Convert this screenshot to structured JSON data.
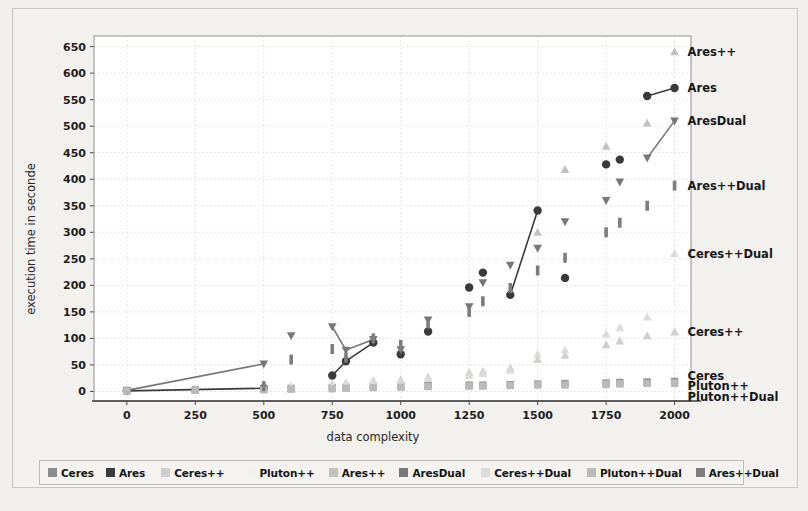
{
  "figure": {
    "background": "#f2f1ee",
    "plot_background": "#ffffff"
  },
  "chart_data": {
    "type": "scatter",
    "title": "",
    "xlabel": "data complexity",
    "ylabel": "execution time in seconde",
    "xlim": [
      -120,
      2060
    ],
    "ylim": [
      -18,
      670
    ],
    "xticks": [
      0,
      250,
      500,
      750,
      1000,
      1250,
      1500,
      1750,
      2000
    ],
    "yticks": [
      0,
      50,
      100,
      150,
      200,
      250,
      300,
      350,
      400,
      450,
      500,
      550,
      600,
      650
    ],
    "grid": true,
    "legend_position": "below-axes",
    "series": [
      {
        "name": "Ceres",
        "color": "#8c8c8c",
        "marker": "square",
        "points": [
          [
            0,
            2
          ],
          [
            250,
            3
          ],
          [
            500,
            5
          ],
          [
            600,
            6
          ],
          [
            750,
            7
          ],
          [
            800,
            8
          ],
          [
            900,
            9
          ],
          [
            1000,
            10
          ],
          [
            1100,
            11
          ],
          [
            1250,
            12
          ],
          [
            1300,
            12
          ],
          [
            1400,
            13
          ],
          [
            1500,
            14
          ],
          [
            1600,
            15
          ],
          [
            1750,
            16
          ],
          [
            1800,
            17
          ],
          [
            1900,
            18
          ],
          [
            2000,
            19
          ]
        ]
      },
      {
        "name": "Ares",
        "color": "#3a3a3a",
        "marker": "circle",
        "points": [
          [
            0,
            1
          ],
          [
            500,
            6
          ],
          [
            750,
            30
          ],
          [
            800,
            57
          ],
          [
            900,
            92
          ],
          [
            1000,
            70
          ],
          [
            1100,
            113
          ],
          [
            1250,
            196
          ],
          [
            1300,
            224
          ],
          [
            1400,
            182
          ],
          [
            1500,
            341
          ],
          [
            1600,
            214
          ],
          [
            1750,
            428
          ],
          [
            1800,
            437
          ],
          [
            1900,
            557
          ],
          [
            2000,
            572
          ]
        ]
      },
      {
        "name": "Ceres++",
        "color": "#d0cfcc",
        "marker": "triangle-up",
        "points": [
          [
            0,
            1
          ],
          [
            250,
            2
          ],
          [
            500,
            8
          ],
          [
            600,
            9
          ],
          [
            750,
            14
          ],
          [
            800,
            16
          ],
          [
            900,
            20
          ],
          [
            1000,
            22
          ],
          [
            1100,
            27
          ],
          [
            1250,
            35
          ],
          [
            1300,
            38
          ],
          [
            1400,
            44
          ],
          [
            1500,
            60
          ],
          [
            1600,
            68
          ],
          [
            1750,
            88
          ],
          [
            1800,
            95
          ],
          [
            1900,
            105
          ],
          [
            2000,
            112
          ]
        ]
      },
      {
        "name": "Pluton++",
        "color": "#a8a6a2",
        "marker": "square",
        "points": [
          [
            0,
            1
          ],
          [
            250,
            2
          ],
          [
            500,
            4
          ],
          [
            600,
            5
          ],
          [
            750,
            6
          ],
          [
            800,
            7
          ],
          [
            900,
            8
          ],
          [
            1000,
            9
          ],
          [
            1100,
            10
          ],
          [
            1250,
            11
          ],
          [
            1300,
            11
          ],
          [
            1400,
            12
          ],
          [
            1500,
            13
          ],
          [
            1600,
            14
          ],
          [
            1750,
            15
          ],
          [
            1800,
            15
          ],
          [
            1900,
            16
          ],
          [
            2000,
            17
          ]
        ]
      },
      {
        "name": "Ares++",
        "color": "#c2c1bd",
        "marker": "triangle-up",
        "points": [
          [
            1500,
            300
          ],
          [
            1600,
            418
          ],
          [
            1750,
            462
          ],
          [
            1900,
            506
          ],
          [
            2000,
            640
          ]
        ]
      },
      {
        "name": "AresDual",
        "color": "#77777a",
        "marker": "triangle-down",
        "points": [
          [
            0,
            2
          ],
          [
            500,
            52
          ],
          [
            600,
            105
          ],
          [
            750,
            122
          ],
          [
            800,
            78
          ],
          [
            900,
            98
          ],
          [
            1000,
            79
          ],
          [
            1100,
            135
          ],
          [
            1250,
            160
          ],
          [
            1300,
            205
          ],
          [
            1400,
            238
          ],
          [
            1500,
            270
          ],
          [
            1600,
            320
          ],
          [
            1750,
            360
          ],
          [
            1800,
            395
          ],
          [
            1900,
            440
          ],
          [
            2000,
            510
          ]
        ]
      },
      {
        "name": "Ceres++Dual",
        "color": "#dcdbd8",
        "marker": "triangle-up",
        "points": [
          [
            0,
            1
          ],
          [
            250,
            2
          ],
          [
            500,
            7
          ],
          [
            600,
            8
          ],
          [
            750,
            12
          ],
          [
            800,
            14
          ],
          [
            900,
            18
          ],
          [
            1000,
            20
          ],
          [
            1100,
            24
          ],
          [
            1250,
            30
          ],
          [
            1300,
            33
          ],
          [
            1400,
            40
          ],
          [
            1500,
            70
          ],
          [
            1600,
            78
          ],
          [
            1750,
            108
          ],
          [
            1800,
            120
          ],
          [
            1900,
            140
          ],
          [
            2000,
            260
          ]
        ]
      },
      {
        "name": "Pluton++Dual",
        "color": "#bcbab6",
        "marker": "square",
        "points": [
          [
            0,
            1
          ],
          [
            250,
            2
          ],
          [
            500,
            3
          ],
          [
            600,
            4
          ],
          [
            750,
            5
          ],
          [
            800,
            6
          ],
          [
            900,
            7
          ],
          [
            1000,
            8
          ],
          [
            1100,
            9
          ],
          [
            1250,
            10
          ],
          [
            1300,
            10
          ],
          [
            1400,
            11
          ],
          [
            1500,
            12
          ],
          [
            1600,
            12
          ],
          [
            1750,
            13
          ],
          [
            1800,
            14
          ],
          [
            1900,
            15
          ],
          [
            2000,
            15
          ]
        ]
      },
      {
        "name": "Ares++Dual",
        "color": "#7d7d80",
        "marker": "bar",
        "points": [
          [
            500,
            10
          ],
          [
            600,
            60
          ],
          [
            750,
            80
          ],
          [
            800,
            64
          ],
          [
            900,
            100
          ],
          [
            1000,
            88
          ],
          [
            1100,
            128
          ],
          [
            1250,
            150
          ],
          [
            1300,
            170
          ],
          [
            1400,
            195
          ],
          [
            1500,
            228
          ],
          [
            1600,
            252
          ],
          [
            1750,
            300
          ],
          [
            1800,
            318
          ],
          [
            1900,
            350
          ],
          [
            2000,
            388
          ]
        ]
      }
    ],
    "connectors": [
      {
        "series": "Ares",
        "from": [
          0,
          1
        ],
        "to": [
          500,
          6
        ]
      },
      {
        "series": "Ares",
        "from": [
          750,
          30
        ],
        "to": [
          800,
          57
        ]
      },
      {
        "series": "Ares",
        "from": [
          800,
          57
        ],
        "to": [
          900,
          92
        ]
      },
      {
        "series": "Ares",
        "from": [
          1400,
          182
        ],
        "to": [
          1500,
          341
        ]
      },
      {
        "series": "Ares",
        "from": [
          1900,
          557
        ],
        "to": [
          2000,
          572
        ]
      },
      {
        "series": "AresDual",
        "from": [
          0,
          2
        ],
        "to": [
          500,
          52
        ]
      },
      {
        "series": "AresDual",
        "from": [
          750,
          122
        ],
        "to": [
          800,
          78
        ]
      },
      {
        "series": "AresDual",
        "from": [
          800,
          78
        ],
        "to": [
          900,
          98
        ]
      },
      {
        "series": "AresDual",
        "from": [
          1900,
          440
        ],
        "to": [
          2000,
          510
        ]
      }
    ],
    "annotations": [
      {
        "label": "Ares++",
        "x": 2000,
        "y": 640
      },
      {
        "label": "Ares",
        "x": 2000,
        "y": 572
      },
      {
        "label": "AresDual",
        "x": 2000,
        "y": 510
      },
      {
        "label": "Ares++Dual",
        "x": 2000,
        "y": 388
      },
      {
        "label": "Ceres++Dual",
        "x": 2000,
        "y": 260
      },
      {
        "label": "Ceres++",
        "x": 2000,
        "y": 112
      },
      {
        "label": "Ceres",
        "x": 2000,
        "y": 30
      },
      {
        "label": "Pluton++",
        "x": 2000,
        "y": 10
      },
      {
        "label": "Pluton++Dual",
        "x": 2000,
        "y": -10
      }
    ]
  },
  "legend": {
    "items": [
      {
        "label": "Ceres",
        "color": "#8c8c8c"
      },
      {
        "label": "Ares",
        "color": "#3a3a3a"
      },
      {
        "label": "Ceres++",
        "color": "#d0cfcc"
      },
      {
        "label": "Pluton++",
        "color": "#f2f1ee"
      },
      {
        "label": "Ares++",
        "color": "#c2c1bd"
      },
      {
        "label": "AresDual",
        "color": "#77777a"
      },
      {
        "label": "Ceres++Dual",
        "color": "#dcdbd8"
      },
      {
        "label": "Pluton++Dual",
        "color": "#bcbab6"
      },
      {
        "label": "Ares++Dual",
        "color": "#7d7d80"
      }
    ]
  }
}
